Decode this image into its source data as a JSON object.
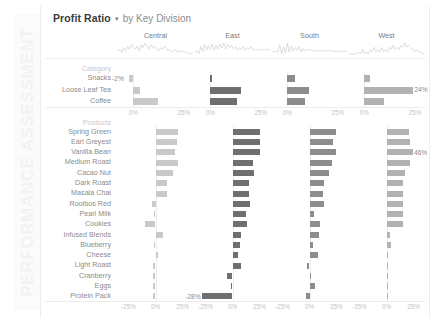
{
  "sidebar": {
    "watermark": "PERFORMANCE ASSESSMENT"
  },
  "header": {
    "measure": "Profit Ratio",
    "caret": "▾",
    "by_text": "by Key Division"
  },
  "axis": {
    "category_ticks": [
      "0%",
      "25%"
    ],
    "product_ticks": [
      "-25%",
      "0%",
      "25%"
    ],
    "tick_0": "0%",
    "tick_25": "25%",
    "tick_neg25": "-25%"
  },
  "sections": {
    "category_header": "Category",
    "products_header": "Products"
  },
  "chart_data": {
    "type": "bar",
    "xlabel": "Profit Ratio",
    "ylabel": "",
    "grid": false,
    "legend": "none",
    "columns": [
      "Central",
      "East",
      "South",
      "West"
    ],
    "column_colors": [
      "#c9c9c9",
      "#6f6f6f",
      "#8d8d8d",
      "#b2b2b2"
    ],
    "panels": [
      {
        "name": "Category",
        "categories": [
          "Snacks",
          "Loose Leaf Tea",
          "Coffee"
        ],
        "xlim": [
          -5,
          27
        ],
        "ticks": [
          0,
          25
        ],
        "series": [
          {
            "name": "Central",
            "values": [
              -2,
              3.5,
              12
            ]
          },
          {
            "name": "East",
            "values": [
              0.8,
              15,
              13
            ]
          },
          {
            "name": "South",
            "values": [
              4,
              11,
              9
            ]
          },
          {
            "name": "West",
            "values": [
              3,
              24,
              10
            ]
          }
        ],
        "labels": [
          {
            "column": "Central",
            "category": "Snacks",
            "text": "-2%"
          },
          {
            "column": "West",
            "category": "Loose Leaf Tea",
            "text": "24%"
          }
        ]
      },
      {
        "name": "Products",
        "categories": [
          "Spring Green",
          "Earl Greyest",
          "Vanilla Bean",
          "Medium Roast",
          "Cacao Nut",
          "Dark Roast",
          "Masala Chai",
          "Rooibos Red",
          "Pearl Milk",
          "Cookies",
          "Infused Blends",
          "Blueberry",
          "Cheese",
          "Light Roast",
          "Cranberry",
          "Eggs",
          "Protein Pack"
        ],
        "xlim": [
          -30,
          30
        ],
        "ticks": [
          -25,
          0,
          25
        ],
        "series": [
          {
            "name": "Central",
            "values": [
              21,
              20,
              18,
              21,
              16,
              11,
              11,
              -3,
              -1,
              -10,
              7,
              -1,
              2,
              -2,
              -2,
              -2,
              -2
            ]
          },
          {
            "name": "East",
            "values": [
              25,
              25,
              25,
              19,
              20,
              15,
              15,
              16,
              12,
              13,
              8,
              7,
              5,
              8,
              -5,
              -1,
              -28
            ]
          },
          {
            "name": "South",
            "values": [
              24,
              22,
              24,
              21,
              18,
              13,
              12,
              13,
              4,
              10,
              9,
              3,
              8,
              -2,
              0,
              5,
              -3
            ]
          },
          {
            "name": "West",
            "values": [
              21,
              22,
              24,
              22,
              17,
              15,
              15,
              15,
              15,
              15,
              3,
              4,
              1,
              1,
              1,
              1,
              1
            ]
          }
        ],
        "labels": [
          {
            "column": "West",
            "category": "Vanilla Bean",
            "text": "46%"
          },
          {
            "column": "East",
            "category": "Protein Pack",
            "text": "-28%"
          }
        ]
      }
    ],
    "sparklines": {
      "Central": [
        8,
        9,
        7,
        10,
        8,
        11,
        9,
        12,
        10,
        9,
        11,
        8,
        12,
        10,
        13,
        11,
        9,
        12,
        10,
        11,
        9,
        8,
        10,
        9,
        11,
        10,
        8,
        9,
        7,
        8,
        9,
        7,
        8,
        7,
        8,
        7,
        6,
        7,
        6,
        7
      ],
      "East": [
        7,
        9,
        6,
        12,
        8,
        14,
        9,
        13,
        10,
        14,
        9,
        13,
        10,
        14,
        11,
        15,
        10,
        14,
        11,
        13,
        10,
        12,
        9,
        11,
        10,
        12,
        9,
        11,
        10,
        12,
        9,
        10,
        9,
        10,
        9,
        10,
        9,
        10,
        9,
        10
      ],
      "South": [
        9,
        8,
        9,
        8,
        16,
        6,
        14,
        7,
        18,
        8,
        15,
        9,
        13,
        10,
        14,
        8,
        12,
        9,
        11,
        10,
        11,
        9,
        10,
        9,
        10,
        9,
        10,
        9,
        10,
        9,
        10,
        9,
        9,
        9,
        9,
        9,
        9,
        9,
        9,
        9
      ],
      "West": [
        9,
        9,
        9,
        9,
        9,
        10,
        9,
        11,
        9,
        10,
        9,
        11,
        10,
        12,
        10,
        11,
        10,
        12,
        10,
        11,
        10,
        12,
        11,
        13,
        11,
        12,
        11,
        13,
        12,
        14,
        12,
        13,
        12,
        11,
        10,
        11,
        10,
        10,
        9,
        9
      ]
    }
  }
}
